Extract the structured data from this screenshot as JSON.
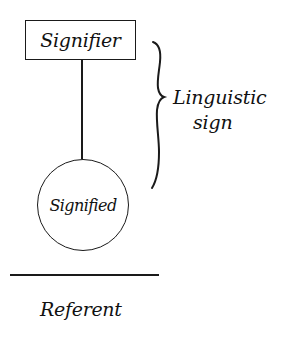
{
  "diagram": {
    "type": "semiotic-triangle-variant",
    "nodes": {
      "signifier": {
        "label": "Signifier",
        "shape": "rectangle"
      },
      "signified": {
        "label": "Signified",
        "shape": "circle"
      },
      "referent": {
        "label": "Referent",
        "shape": "text-below-line"
      }
    },
    "edges": [
      {
        "from": "signifier",
        "to": "signified",
        "style": "solid-line"
      }
    ],
    "brace": {
      "spans": [
        "signifier",
        "signified"
      ],
      "label_line1": "Linguistic",
      "label_line2": "sign"
    },
    "divider": {
      "separates": [
        "signified",
        "referent"
      ]
    },
    "colors": {
      "ink": "#111111",
      "background": "#ffffff"
    }
  }
}
